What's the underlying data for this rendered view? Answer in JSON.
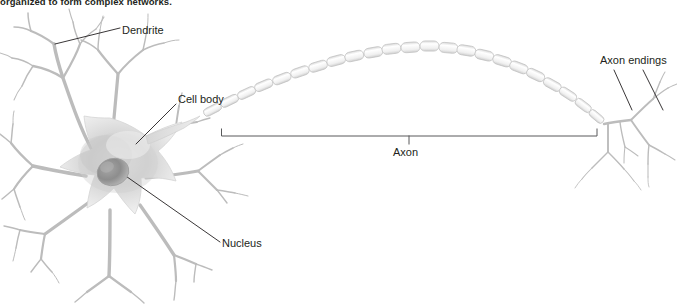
{
  "figure": {
    "caption": "organized to form complex networks.",
    "width": 677,
    "height": 305,
    "background_color": "#ffffff"
  },
  "labels": {
    "dendrite": "Dendrite",
    "cell_body": "Cell body",
    "nucleus": "Nucleus",
    "axon": "Axon",
    "axon_endings": "Axon endings"
  },
  "icons": {
    "soma": "cell-body-icon",
    "nucleus": "nucleus-icon",
    "dendrite_tree": "dendrite-icon",
    "myelin_axon": "axon-icon",
    "axon_terminals": "axon-endings-icon",
    "axon_bracket": "bracket-icon"
  },
  "colors": {
    "text": "#231f20",
    "leader_line": "#231f20",
    "bracket": "#58595b",
    "soma_fill_light": "#f2f2f2",
    "soma_fill_mid": "#c9c9c9",
    "soma_fill_dark": "#9a9a9a",
    "nucleus_fill": "#8c8c8c",
    "dendrite_stroke": "#bdbdbd",
    "myelin_stroke": "#c4c4c4",
    "myelin_fill": "#fbfbfb"
  },
  "annotations": {
    "axon_bracket": {
      "left_x": 221,
      "right_x": 597,
      "baseline_y": 136,
      "center_tick_x": 409
    }
  }
}
